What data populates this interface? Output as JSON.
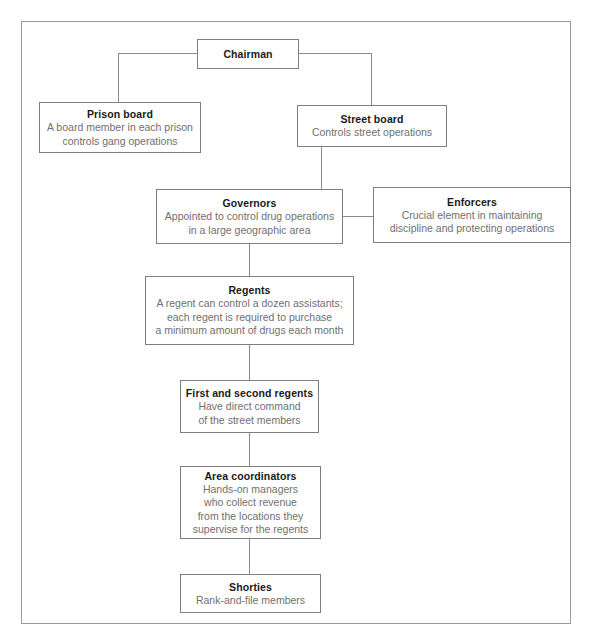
{
  "diagram": {
    "type": "org-chart",
    "colors": {
      "frame_border": "#9a9a9a",
      "box_border": "#7d7d7d",
      "connector": "#8c8c8c",
      "title_text": "#1a1a1a",
      "body_text": "#6f6f6f",
      "background": "#ffffff"
    },
    "nodes": [
      {
        "id": "chairman",
        "title": "Chairman",
        "desc": ""
      },
      {
        "id": "prison-board",
        "title": "Prison board",
        "desc": "A board member in each prison\ncontrols gang operations"
      },
      {
        "id": "street-board",
        "title": "Street board",
        "desc": "Controls street operations"
      },
      {
        "id": "governors",
        "title": "Governors",
        "desc": "Appointed to control drug operations\nin a large geographic area"
      },
      {
        "id": "enforcers",
        "title": "Enforcers",
        "desc": "Crucial element in maintaining\ndiscipline and protecting operations"
      },
      {
        "id": "regents",
        "title": "Regents",
        "desc": "A regent can control a dozen assistants;\neach regent is required to purchase\na minimum amount of drugs each month"
      },
      {
        "id": "first-second-regents",
        "title": "First and second regents",
        "desc": "Have direct command\nof the street members"
      },
      {
        "id": "area-coordinators",
        "title": "Area coordinators",
        "desc": "Hands-on managers\nwho collect revenue\nfrom the locations they\nsupervise for the regents"
      },
      {
        "id": "shorties",
        "title": "Shorties",
        "desc": "Rank-and-file members"
      }
    ],
    "edges": [
      {
        "from": "chairman",
        "to": "prison-board"
      },
      {
        "from": "chairman",
        "to": "street-board"
      },
      {
        "from": "street-board",
        "to": "governors"
      },
      {
        "from": "governors",
        "to": "enforcers"
      },
      {
        "from": "governors",
        "to": "regents"
      },
      {
        "from": "regents",
        "to": "first-second-regents"
      },
      {
        "from": "first-second-regents",
        "to": "area-coordinators"
      },
      {
        "from": "area-coordinators",
        "to": "shorties"
      }
    ]
  }
}
